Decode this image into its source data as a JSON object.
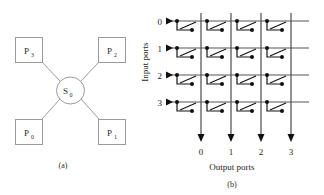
{
  "figure": {
    "panels": [
      {
        "id": "a",
        "caption": "(a)",
        "kind": "star-topology",
        "center_node": {
          "label": "S",
          "subscript": "0",
          "shape": "circle"
        },
        "peripheral_nodes": [
          {
            "label": "P",
            "subscript": "3",
            "position": "top-left"
          },
          {
            "label": "P",
            "subscript": "2",
            "position": "top-right"
          },
          {
            "label": "P",
            "subscript": "0",
            "position": "bottom-left"
          },
          {
            "label": "P",
            "subscript": "1",
            "position": "bottom-right"
          }
        ]
      },
      {
        "id": "b",
        "caption": "(b)",
        "kind": "crossbar-switch",
        "y_axis_title": "Input ports",
        "x_axis_title": "Output ports",
        "input_port_labels": [
          "0",
          "1",
          "2",
          "3"
        ],
        "output_port_labels": [
          "0",
          "1",
          "2",
          "3"
        ],
        "grid_size": 4,
        "crosspoints": [
          [
            0,
            0,
            0,
            0
          ],
          [
            1,
            0,
            0,
            0
          ],
          [
            0,
            0,
            0,
            0
          ],
          [
            0,
            0,
            0,
            0
          ]
        ]
      }
    ]
  },
  "colors": {
    "ink": "#101010",
    "wire": "#3a3a3a",
    "bus": "#555555",
    "node_stroke": "#9a9a9a",
    "background": "#ffffff"
  }
}
